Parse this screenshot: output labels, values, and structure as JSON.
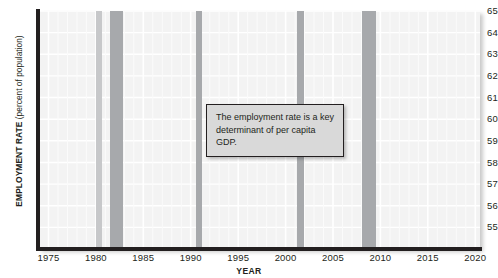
{
  "chart_data": {
    "type": "line",
    "title": "",
    "xlabel": "YEAR",
    "ylabel": "EMPLOYMENT RATE (percent of population)",
    "ylabel_bold": "EMPLOYMENT RATE",
    "ylabel_normal": "(percent of population)",
    "xlim": [
      1974,
      2020.5
    ],
    "ylim": [
      54,
      65
    ],
    "grid": true,
    "legend": "none",
    "yticks": [
      55,
      56,
      57,
      58,
      59,
      60,
      61,
      62,
      63,
      64,
      65
    ],
    "xticks": [
      1975,
      1980,
      1985,
      1990,
      1995,
      2000,
      2005,
      2010,
      2015,
      2020
    ],
    "series": [
      {
        "name": "Employment rate",
        "color": "#231f20",
        "x": [
          1975,
          1976,
          1977,
          1978,
          1979,
          1980,
          1981,
          1982,
          1983,
          1984,
          1985,
          1986,
          1987,
          1988,
          1989,
          1990,
          1991,
          1992,
          1993,
          1994,
          1995,
          1996,
          1997,
          1998,
          1999,
          2000,
          2001,
          2002,
          2003,
          2004,
          2005,
          2006,
          2007,
          2008,
          2009,
          2010,
          2011,
          2012,
          2013,
          2014,
          2015,
          2016,
          2017,
          2018,
          2019,
          2020
        ],
        "values": [
          56.1,
          56.8,
          57.9,
          59.3,
          60.0,
          59.2,
          59.0,
          57.8,
          57.8,
          59.5,
          60.1,
          60.7,
          61.5,
          62.3,
          63.0,
          62.8,
          61.7,
          61.5,
          61.7,
          62.5,
          62.9,
          63.2,
          63.8,
          64.1,
          64.3,
          64.4,
          63.7,
          62.7,
          62.3,
          62.3,
          62.7,
          63.1,
          63.0,
          62.2,
          59.3,
          58.5,
          58.4,
          58.6,
          58.6,
          59.0,
          59.3,
          59.7,
          60.1,
          60.4,
          61.0,
          58.1
        ]
      }
    ],
    "recession_bands": [
      {
        "start": 1980.0,
        "end": 1980.6,
        "shade": "light"
      },
      {
        "start": 1981.5,
        "end": 1982.9,
        "shade": "dark"
      },
      {
        "start": 1990.5,
        "end": 1991.2,
        "shade": "dark"
      },
      {
        "start": 2001.2,
        "end": 2001.9,
        "shade": "dark"
      },
      {
        "start": 2008.0,
        "end": 2009.5,
        "shade": "dark"
      }
    ],
    "annotation": {
      "text": "The employment rate is a key determinant of per capita GDP.",
      "line1": "The employment rate is a key",
      "line2": "determinant of per capita GDP."
    },
    "colors": {
      "line": "#231f20",
      "axis": "#231f20",
      "plot_background": "#f3f3f3",
      "gridline": "#ffffff",
      "recession_dark": "#a7a9ac",
      "recession_light": "#c7c8ca",
      "annotation_background": "#d9d9d9"
    }
  }
}
